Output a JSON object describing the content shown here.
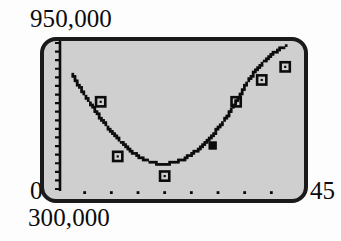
{
  "figure": {
    "background_color": "#fdfdfd",
    "plot_fill_color": "#cfcfcf",
    "plot_border_color": "#1a1a1a",
    "ink_color": "#0b0b0b"
  },
  "labels": {
    "y_max": "950,000",
    "y_min": "300,000",
    "x_min": "0",
    "x_max": "45"
  },
  "chart_data": {
    "type": "scatter",
    "title": "",
    "xlabel": "",
    "ylabel": "",
    "xlim": [
      0,
      45
    ],
    "ylim": [
      300000,
      950000
    ],
    "grid": false,
    "legend": false,
    "legend_position": "none",
    "x_tick_labels": [
      "0",
      "45"
    ],
    "y_tick_labels": [
      "300,000",
      "950,000"
    ],
    "x_tick_marks": [
      5,
      10,
      15,
      20,
      25,
      30,
      35,
      40
    ],
    "series": [
      {
        "name": "data points",
        "marker": "open-square",
        "points": [
          {
            "x": 8.0,
            "y": 690000,
            "marker": "open-square"
          },
          {
            "x": 11.2,
            "y": 440000,
            "marker": "open-square"
          },
          {
            "x": 20.0,
            "y": 350000,
            "marker": "open-square"
          },
          {
            "x": 29.0,
            "y": 490000,
            "marker": "filled-square"
          },
          {
            "x": 33.4,
            "y": 690000,
            "marker": "open-square"
          },
          {
            "x": 38.2,
            "y": 790000,
            "marker": "open-square"
          },
          {
            "x": 42.6,
            "y": 850000,
            "marker": "open-square"
          }
        ]
      },
      {
        "name": "quadratic fit curve",
        "style": "dotted-trace",
        "vertex": {
          "x": 19.5,
          "y": 405000
        },
        "points": [
          {
            "x": 2.7,
            "y": 818000
          },
          {
            "x": 4.0,
            "y": 760000
          },
          {
            "x": 5.5,
            "y": 705000
          },
          {
            "x": 7.0,
            "y": 650000
          },
          {
            "x": 8.5,
            "y": 600000
          },
          {
            "x": 10.0,
            "y": 555000
          },
          {
            "x": 11.5,
            "y": 513000
          },
          {
            "x": 13.0,
            "y": 478000
          },
          {
            "x": 14.5,
            "y": 450000
          },
          {
            "x": 16.0,
            "y": 428000
          },
          {
            "x": 17.5,
            "y": 414000
          },
          {
            "x": 19.0,
            "y": 406000
          },
          {
            "x": 20.5,
            "y": 406000
          },
          {
            "x": 22.0,
            "y": 413000
          },
          {
            "x": 23.5,
            "y": 427000
          },
          {
            "x": 25.0,
            "y": 448000
          },
          {
            "x": 26.5,
            "y": 476000
          },
          {
            "x": 28.0,
            "y": 510000
          },
          {
            "x": 29.5,
            "y": 551000
          },
          {
            "x": 31.0,
            "y": 598000
          },
          {
            "x": 32.5,
            "y": 652000
          },
          {
            "x": 34.0,
            "y": 712000
          },
          {
            "x": 35.5,
            "y": 779000
          },
          {
            "x": 37.0,
            "y": 830000
          },
          {
            "x": 38.5,
            "y": 872000
          },
          {
            "x": 40.0,
            "y": 905000
          },
          {
            "x": 41.5,
            "y": 930000
          },
          {
            "x": 42.8,
            "y": 945000
          }
        ]
      }
    ]
  }
}
